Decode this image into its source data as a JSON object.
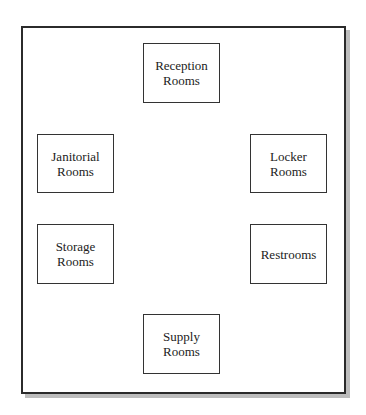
{
  "diagram": {
    "type": "floor-plan-grouping",
    "container": {
      "shape": "rectangle-with-drop-shadow",
      "border_color": "#2b2b2b",
      "shadow_color": "#bdbdbd"
    },
    "rooms": [
      {
        "id": "reception",
        "label": "Reception\nRooms",
        "position": "top-center",
        "box": {
          "x": 143,
          "y": 43,
          "w": 77,
          "h": 60
        }
      },
      {
        "id": "janitorial",
        "label": "Janitorial\nRooms",
        "position": "upper-left",
        "box": {
          "x": 37,
          "y": 134,
          "w": 77,
          "h": 59
        }
      },
      {
        "id": "locker",
        "label": "Locker\nRooms",
        "position": "upper-right",
        "box": {
          "x": 250,
          "y": 134,
          "w": 77,
          "h": 59
        }
      },
      {
        "id": "storage",
        "label": "Storage\nRooms",
        "position": "lower-left",
        "box": {
          "x": 37,
          "y": 224,
          "w": 77,
          "h": 60
        }
      },
      {
        "id": "restrooms",
        "label": "Restrooms",
        "position": "lower-right",
        "box": {
          "x": 250,
          "y": 224,
          "w": 77,
          "h": 60
        }
      },
      {
        "id": "supply",
        "label": "Supply\nRooms",
        "position": "bottom-center",
        "box": {
          "x": 143,
          "y": 314,
          "w": 77,
          "h": 60
        }
      }
    ]
  }
}
